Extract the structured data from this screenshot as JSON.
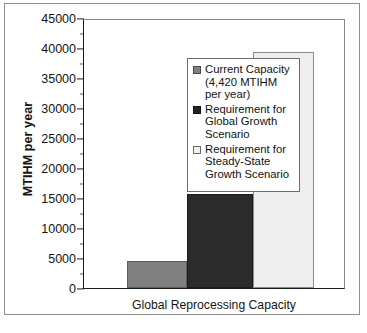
{
  "chart_data": {
    "type": "bar",
    "title": "",
    "xlabel": "Global Reprocessing Capacity",
    "ylabel": "MTIHM per year",
    "ylim": [
      0,
      45000
    ],
    "ytick_step": 5000,
    "yminor_step": 2500,
    "grid": false,
    "legend_position": "inside-upper-left",
    "categories": [
      "Current Capacity (4,420 MTIHM per year)",
      "Requirement for Global Growth Scenario",
      "Requirement for Steady-State Growth Scenario"
    ],
    "values": [
      4420,
      15700,
      39400
    ],
    "tick_labels": [
      "45000",
      "40000",
      "35000",
      "30000",
      "25000",
      "20000",
      "15000",
      "10000",
      "5000",
      "0"
    ],
    "tick_values": [
      45000,
      40000,
      35000,
      30000,
      25000,
      20000,
      15000,
      10000,
      5000,
      0
    ],
    "colors": {
      "current": "#808080",
      "global_growth": "#2b2b2b",
      "steady_state": "#eeeeee",
      "axis": "#1a1a1a",
      "frame": "#8f8f8f"
    }
  },
  "legend": {
    "entries": [
      {
        "swatch": "legend-swatch-current-capacity",
        "label": "Current Capacity (4,420 MTIHM per year)"
      },
      {
        "swatch": "legend-swatch-global-growth",
        "label": "Requirement for Global Growth Scenario"
      },
      {
        "swatch": "legend-swatch-steady-state",
        "label": "Requirement for Steady-State Growth Scenario"
      }
    ]
  },
  "axes": {
    "y_title": "MTIHM per year",
    "x_title": "Global Reprocessing Capacity"
  }
}
